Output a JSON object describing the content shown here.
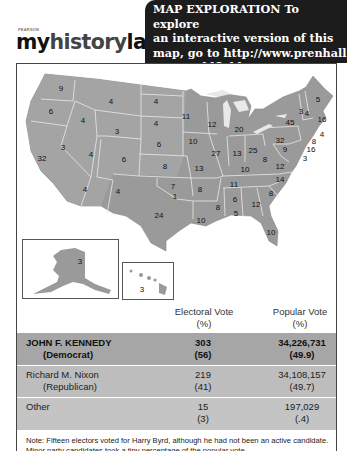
{
  "header": {
    "publisher": "PEARSON",
    "brand_part1": "my",
    "brand_part2": "history",
    "brand_part3": "lab",
    "promo_lines": [
      "MAP EXPLORATION  To explore",
      "an interactive version of this",
      "map, go to  http://www.prenhall",
      ".com/goldfield5/map28.2"
    ]
  },
  "colors": {
    "promo_bg": "#1c1c1c",
    "kennedy_state": "#8e8e8e",
    "nixon_state": "#a8a8a8",
    "byrd_state": "#b9b9b9",
    "row_kennedy": "#a6a6a6",
    "row_nixon": "#bdbdbd",
    "row_other": "#c4c4c4"
  },
  "map": {
    "states": [
      {
        "abbr": "WA",
        "votes": "9",
        "x": 44,
        "y": 24
      },
      {
        "abbr": "OR",
        "votes": "6",
        "x": 34,
        "y": 47
      },
      {
        "abbr": "ID",
        "votes": "4",
        "x": 66,
        "y": 56
      },
      {
        "abbr": "MT",
        "votes": "4",
        "x": 94,
        "y": 37
      },
      {
        "abbr": "WY",
        "votes": "3",
        "x": 100,
        "y": 67
      },
      {
        "abbr": "ND",
        "votes": "4",
        "x": 139,
        "y": 37
      },
      {
        "abbr": "SD",
        "votes": "4",
        "x": 139,
        "y": 59
      },
      {
        "abbr": "NE",
        "votes": "6",
        "x": 142,
        "y": 80
      },
      {
        "abbr": "KS",
        "votes": "8",
        "x": 148,
        "y": 102
      },
      {
        "abbr": "CO",
        "votes": "6",
        "x": 107,
        "y": 95
      },
      {
        "abbr": "UT",
        "votes": "4",
        "x": 74,
        "y": 90
      },
      {
        "abbr": "NV",
        "votes": "3",
        "x": 46,
        "y": 83
      },
      {
        "abbr": "CA",
        "votes": "32",
        "x": 25,
        "y": 94
      },
      {
        "abbr": "AZ",
        "votes": "4",
        "x": 68,
        "y": 125
      },
      {
        "abbr": "NM",
        "votes": "4",
        "x": 101,
        "y": 127
      },
      {
        "abbr": "OK",
        "votes": "7",
        "x": 156,
        "y": 122
      },
      {
        "abbr": "OK-Byrd",
        "votes": "1",
        "x": 158,
        "y": 132
      },
      {
        "abbr": "TX",
        "votes": "24",
        "x": 142,
        "y": 151
      },
      {
        "abbr": "MN",
        "votes": "11",
        "x": 169,
        "y": 52
      },
      {
        "abbr": "WI",
        "votes": "12",
        "x": 195,
        "y": 60
      },
      {
        "abbr": "IA",
        "votes": "10",
        "x": 176,
        "y": 77
      },
      {
        "abbr": "MO",
        "votes": "13",
        "x": 182,
        "y": 104
      },
      {
        "abbr": "AR",
        "votes": "8",
        "x": 183,
        "y": 125
      },
      {
        "abbr": "LA",
        "votes": "10",
        "x": 184,
        "y": 156
      },
      {
        "abbr": "IL",
        "votes": "27",
        "x": 199,
        "y": 89
      },
      {
        "abbr": "MI",
        "votes": "20",
        "x": 222,
        "y": 65
      },
      {
        "abbr": "IN",
        "votes": "13",
        "x": 220,
        "y": 89
      },
      {
        "abbr": "OH",
        "votes": "25",
        "x": 236,
        "y": 86
      },
      {
        "abbr": "KY",
        "votes": "10",
        "x": 228,
        "y": 105
      },
      {
        "abbr": "TN",
        "votes": "11",
        "x": 217,
        "y": 120
      },
      {
        "abbr": "MS",
        "votes": "8",
        "x": 201,
        "y": 143
      },
      {
        "abbr": "AL",
        "votes": "6",
        "x": 218,
        "y": 135
      },
      {
        "abbr": "AL-Byrd",
        "votes": "5",
        "x": 219,
        "y": 149
      },
      {
        "abbr": "GA",
        "votes": "12",
        "x": 239,
        "y": 140
      },
      {
        "abbr": "FL",
        "votes": "10",
        "x": 254,
        "y": 168
      },
      {
        "abbr": "SC",
        "votes": "8",
        "x": 254,
        "y": 129
      },
      {
        "abbr": "NC",
        "votes": "14",
        "x": 263,
        "y": 115
      },
      {
        "abbr": "VA",
        "votes": "12",
        "x": 263,
        "y": 102
      },
      {
        "abbr": "WV",
        "votes": "8",
        "x": 248,
        "y": 95
      },
      {
        "abbr": "PA",
        "votes": "32",
        "x": 263,
        "y": 76
      },
      {
        "abbr": "NY",
        "votes": "45",
        "x": 273,
        "y": 58
      },
      {
        "abbr": "VT",
        "votes": "3",
        "x": 284,
        "y": 47
      },
      {
        "abbr": "NH",
        "votes": "4",
        "x": 290,
        "y": 49
      },
      {
        "abbr": "ME",
        "votes": "5",
        "x": 301,
        "y": 35
      },
      {
        "abbr": "MA",
        "votes": "16",
        "x": 305,
        "y": 55
      },
      {
        "abbr": "RI",
        "votes": "4",
        "x": 305,
        "y": 70
      },
      {
        "abbr": "CT",
        "votes": "8",
        "x": 297,
        "y": 77
      },
      {
        "abbr": "NJ",
        "votes": "16",
        "x": 294,
        "y": 85
      },
      {
        "abbr": "DE",
        "votes": "3",
        "x": 288,
        "y": 94
      },
      {
        "abbr": "MD",
        "votes": "9",
        "x": 268,
        "y": 85
      }
    ],
    "alaska": {
      "votes": "3"
    },
    "hawaii": {
      "votes": "3"
    }
  },
  "table": {
    "headers": {
      "electoral": "Electoral Vote",
      "electoral_unit": "(%)",
      "popular": "Popular Vote",
      "popular_unit": "(%)"
    },
    "rows": [
      {
        "name": "JOHN F. KENNEDY",
        "party": "(Democrat)",
        "ev": "303",
        "ev_pct": "(56)",
        "pv": "34,226,731",
        "pv_pct": "(49.9)"
      },
      {
        "name": "Richard M. Nixon",
        "party": "(Republican)",
        "ev": "219",
        "ev_pct": "(41)",
        "pv": "34,108,157",
        "pv_pct": "(49.7)"
      },
      {
        "name": "Other",
        "party": "",
        "ev": "15",
        "ev_pct": "(3)",
        "pv": "197,029",
        "pv_pct": "(.4)"
      }
    ],
    "note": "Note:  Fifteen electors voted for Harry Byrd, although he had not been an active candidate.  Minor party candidates took a tiny percentage of the popular vote."
  }
}
